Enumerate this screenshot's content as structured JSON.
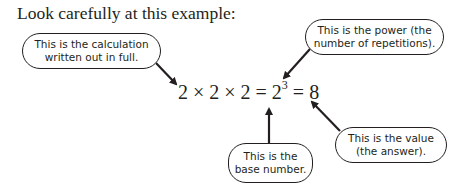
{
  "title": "Look carefully at this example:",
  "equation": {
    "expanded": "2 × 2 × 2",
    "equals1": "=",
    "base": "2",
    "power": "3",
    "equals2": "=",
    "value": "8"
  },
  "callouts": {
    "calculation": {
      "line1": "This is the calculation",
      "line2": "written out in full."
    },
    "power": {
      "line1": "This is the power (the",
      "line2": "number of repetitions)."
    },
    "base": {
      "line1": "This is the",
      "line2": "base number."
    },
    "value": {
      "line1": "This is the value",
      "line2": "(the answer)."
    }
  },
  "colors": {
    "ink": "#231f20",
    "background": "#ffffff"
  }
}
